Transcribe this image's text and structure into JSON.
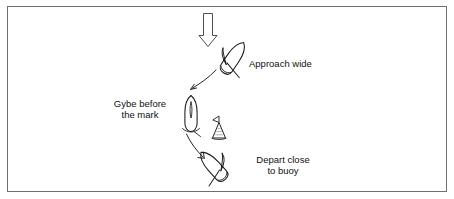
{
  "figure": {
    "kind": "sailing-tactics-diagram",
    "title_visible": false,
    "border_color": "#6f6f6f",
    "ink_color": "#1a1a1a",
    "background_color": "#ffffff"
  },
  "labels": {
    "approach_wide": "Approach wide",
    "gybe_before_mark_line1": "Gybe before",
    "gybe_before_mark_line2": "the mark",
    "depart_close_line1": "Depart close",
    "depart_close_line2": "to buoy"
  },
  "elements": {
    "wind_arrow": {
      "name": "wind-direction-arrow",
      "direction": "down",
      "style": "hollow-outline"
    },
    "boat_1": {
      "name": "boat-approach-wide",
      "heading": "down-left",
      "rotation_deg": 35
    },
    "boat_2": {
      "name": "boat-gybe-before-mark",
      "heading": "down",
      "rotation_deg": 0
    },
    "boat_3": {
      "name": "boat-depart-close-to-buoy",
      "heading": "down-right",
      "rotation_deg": -40
    },
    "buoy": {
      "name": "buoy-mark",
      "shape": "conical-with-flag"
    },
    "track_arrow_1": {
      "name": "track-arrow-approach-to-gybe"
    },
    "track_arrow_2": {
      "name": "track-arrow-gybe-to-depart"
    }
  }
}
